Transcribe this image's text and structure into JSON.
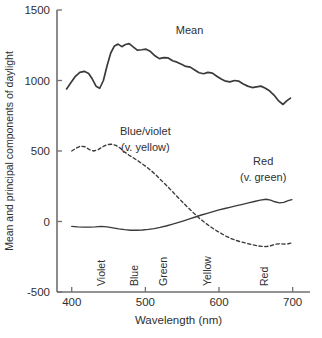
{
  "chart_data": {
    "type": "line",
    "title": "",
    "xlabel": "Wavelength (nm)",
    "ylabel": "Mean and principal components of daylight",
    "xlim": [
      380,
      710
    ],
    "ylim": [
      -500,
      1500
    ],
    "xticks": [
      400,
      500,
      600,
      700
    ],
    "xticklabels": [
      "400",
      "500",
      "600",
      "700"
    ],
    "yticks": [
      -500,
      0,
      500,
      1000,
      1500
    ],
    "yticklabels": [
      "-500",
      "0",
      "500",
      "1000",
      "1500"
    ],
    "grid": false,
    "legend": "inline-annotations",
    "annotations": [
      {
        "name": "mean-label",
        "text": "Mean",
        "x": 560,
        "y": 1330
      },
      {
        "name": "blue-violet-label-line1",
        "text": "Blue/violet",
        "x": 500,
        "y": 610
      },
      {
        "name": "blue-violet-label-line2",
        "text": "(v. yellow)",
        "x": 500,
        "y": 500
      },
      {
        "name": "red-label-line1",
        "text": "Red",
        "x": 660,
        "y": 400
      },
      {
        "name": "red-label-line2",
        "text": "(v. green)",
        "x": 660,
        "y": 290
      }
    ],
    "band_labels": [
      {
        "label": "Violet",
        "x": 445
      },
      {
        "label": "Blue",
        "x": 490
      },
      {
        "label": "Green",
        "x": 530
      },
      {
        "label": "Yellow",
        "x": 589
      },
      {
        "label": "Red",
        "x": 666
      }
    ],
    "series": [
      {
        "name": "Mean",
        "style": "solid",
        "color": "#3a3a3a",
        "x": [
          393,
          399,
          405,
          411,
          417,
          423,
          428,
          433,
          438,
          443,
          448,
          453,
          458,
          463,
          468,
          473,
          478,
          483,
          489,
          495,
          501,
          507,
          513,
          519,
          525,
          531,
          537,
          543,
          549,
          555,
          561,
          567,
          573,
          579,
          585,
          591,
          597,
          603,
          609,
          615,
          621,
          627,
          633,
          639,
          645,
          651,
          657,
          663,
          669,
          675,
          681,
          687,
          692,
          697
        ],
        "y": [
          940,
          985,
          1030,
          1058,
          1065,
          1050,
          1010,
          960,
          945,
          1000,
          1105,
          1195,
          1245,
          1258,
          1240,
          1255,
          1262,
          1240,
          1215,
          1218,
          1222,
          1205,
          1175,
          1155,
          1162,
          1160,
          1140,
          1130,
          1115,
          1100,
          1095,
          1075,
          1055,
          1048,
          1058,
          1052,
          1030,
          1010,
          995,
          990,
          1000,
          995,
          975,
          960,
          950,
          955,
          960,
          945,
          925,
          895,
          855,
          830,
          855,
          875
        ]
      },
      {
        "name": "Blue/violet (v. yellow)",
        "style": "dashed",
        "color": "#3a3a3a",
        "x": [
          400,
          406,
          412,
          418,
          424,
          430,
          436,
          442,
          448,
          454,
          460,
          466,
          472,
          478,
          484,
          490,
          496,
          502,
          508,
          514,
          520,
          526,
          532,
          538,
          544,
          550,
          556,
          562,
          568,
          574,
          580,
          586,
          592,
          598,
          604,
          610,
          616,
          622,
          628,
          634,
          640,
          646,
          652,
          658,
          664,
          670,
          676,
          682,
          688,
          694,
          699
        ],
        "y": [
          500,
          520,
          535,
          530,
          510,
          500,
          510,
          530,
          545,
          548,
          540,
          520,
          492,
          470,
          450,
          430,
          408,
          385,
          360,
          332,
          300,
          270,
          238,
          205,
          172,
          140,
          108,
          78,
          48,
          20,
          -5,
          -28,
          -50,
          -70,
          -88,
          -105,
          -120,
          -132,
          -142,
          -150,
          -158,
          -165,
          -172,
          -176,
          -178,
          -172,
          -162,
          -158,
          -160,
          -158,
          -152
        ]
      },
      {
        "name": "Red (v. green)",
        "style": "solid",
        "color": "#3a3a3a",
        "x": [
          400,
          408,
          416,
          424,
          432,
          440,
          448,
          456,
          464,
          472,
          480,
          488,
          496,
          504,
          512,
          520,
          528,
          536,
          544,
          552,
          560,
          568,
          576,
          584,
          592,
          600,
          608,
          616,
          624,
          632,
          640,
          648,
          656,
          664,
          670,
          676,
          682,
          688,
          694,
          699
        ],
        "y": [
          -35,
          -38,
          -40,
          -40,
          -38,
          -35,
          -38,
          -45,
          -52,
          -58,
          -62,
          -62,
          -60,
          -56,
          -50,
          -42,
          -32,
          -20,
          -8,
          5,
          18,
          32,
          46,
          58,
          70,
          82,
          92,
          102,
          112,
          122,
          132,
          142,
          152,
          158,
          152,
          140,
          132,
          136,
          148,
          155
        ]
      }
    ]
  }
}
